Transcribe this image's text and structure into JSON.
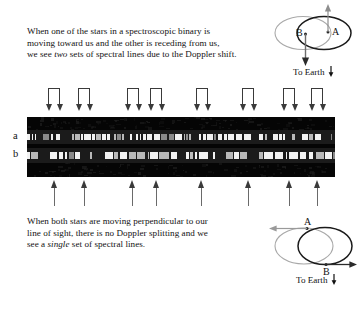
{
  "figure": {
    "top_text": {
      "line1_pre": "When one of the stars in a spectroscopic binary is",
      "line2_pre": "moving toward us and the other is receding from us,",
      "line3_pre": "we see ",
      "line3_em": "two",
      "line3_post": " sets of spectral lines due to the Doppler shift."
    },
    "bottom_text": {
      "line1": "When both stars are moving perpendicular to our",
      "line2": "line of sight, there is no Doppler splitting and we",
      "line3_pre": "see a ",
      "line3_em": "single",
      "line3_post": " set of spectral lines."
    }
  },
  "orbit_top": {
    "star_a_label": "A",
    "star_b_label": "B",
    "to_earth_label": "To Earth",
    "motion_a": "up",
    "motion_b": "down",
    "ellipse_a_color": "#1a1a1a",
    "ellipse_b_color": "#a8a8a8"
  },
  "orbit_bottom": {
    "star_a_label": "A",
    "star_b_label": "B",
    "to_earth_label": "To Earth",
    "motion_a": "left",
    "motion_b": "right",
    "ellipse_a_color": "#a8a8a8",
    "ellipse_b_color": "#1a1a1a"
  },
  "spectrum": {
    "row_labels": {
      "a": "a",
      "b": "b"
    },
    "background_color": "#050505",
    "line_color": "#f2f2f2",
    "top_marker_count": 8,
    "bottom_marker_count": 8,
    "top_marker_x": [
      48,
      78,
      127,
      150,
      196,
      242,
      283,
      311
    ],
    "bottom_marker_x": [
      50,
      80,
      128,
      152,
      197,
      244,
      285,
      313
    ],
    "top_marker_pair_gap": 11
  },
  "chart_data": {
    "type": "table",
    "series": [
      {
        "name": "a",
        "description": "spectrum row a - double (split) absorption lines"
      },
      {
        "name": "b",
        "description": "spectrum row b - single (unsplit) absorption lines"
      }
    ],
    "annotations": [
      "two sets of spectral lines due to the Doppler shift",
      "a single set of spectral lines"
    ]
  }
}
